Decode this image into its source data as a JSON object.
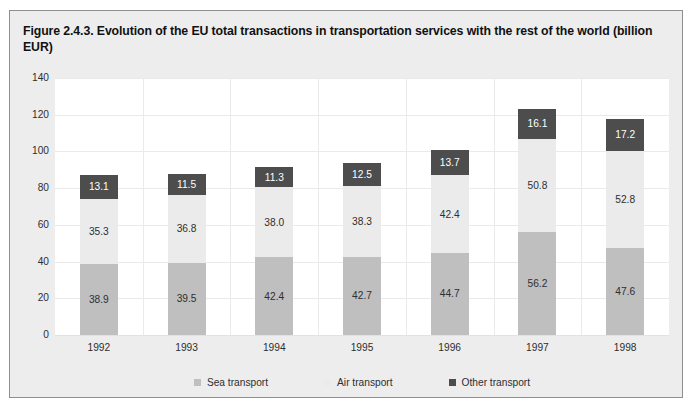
{
  "figure": {
    "title": "Figure 2.4.3. Evolution of the EU total transactions in transportation services with the rest of the world (billion EUR)"
  },
  "colors": {
    "sea": "#bfbfbf",
    "air": "#ebebeb",
    "other": "#4d4d4d",
    "panel_background": "#ededed",
    "plot_background": "#ffffff",
    "gridline": "#eaeaea"
  },
  "chart_data": {
    "type": "bar",
    "stacked": true,
    "title": "Figure 2.4.3. Evolution of the EU total transactions in transportation services with the rest of the world (billion EUR)",
    "xlabel": "",
    "ylabel": "",
    "unit": "billion EUR",
    "grid": true,
    "legend_position": "bottom",
    "categories": [
      "1992",
      "1993",
      "1994",
      "1995",
      "1996",
      "1997",
      "1998"
    ],
    "ylim": [
      0,
      140
    ],
    "yticks": [
      "0",
      "20",
      "40",
      "60",
      "80",
      "100",
      "120",
      "140"
    ],
    "series": [
      {
        "name": "Sea transport",
        "color": "#bfbfbf",
        "values": [
          38.9,
          39.5,
          42.4,
          42.7,
          44.7,
          56.2,
          47.6
        ]
      },
      {
        "name": "Air transport",
        "color": "#ebebeb",
        "values": [
          35.3,
          36.8,
          38.0,
          38.3,
          42.4,
          50.8,
          52.8
        ]
      },
      {
        "name": "Other transport",
        "color": "#4d4d4d",
        "values": [
          13.1,
          11.5,
          11.3,
          12.5,
          13.7,
          16.1,
          17.2
        ]
      }
    ],
    "value_labels": {
      "1992": {
        "sea": "38.9",
        "air": "35.3",
        "other": "13.1"
      },
      "1993": {
        "sea": "39.5",
        "air": "36.8",
        "other": "11.5"
      },
      "1994": {
        "sea": "42.4",
        "air": "38.0",
        "other": "11.3"
      },
      "1995": {
        "sea": "42.7",
        "air": "38.3",
        "other": "12.5"
      },
      "1996": {
        "sea": "44.7",
        "air": "42.4",
        "other": "13.7"
      },
      "1997": {
        "sea": "56.2",
        "air": "50.8",
        "other": "16.1"
      },
      "1998": {
        "sea": "47.6",
        "air": "52.8",
        "other": "17.2"
      }
    }
  }
}
